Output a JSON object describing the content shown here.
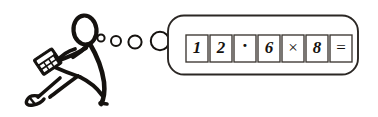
{
  "illustration": {
    "title": "Seated stick figure using a calculator with a thought bubble",
    "background_color": "#ffffff",
    "ink_color": "#15120f",
    "width": 378,
    "height": 117
  },
  "figure": {
    "label": "stick-figure-person",
    "parts": {
      "head": "oval head",
      "torso": "curved back",
      "arms": "bent arms holding calculator",
      "legs": "bent legs with shoe",
      "shoe": "shoe at left foot"
    }
  },
  "calculator": {
    "label": "handheld-calculator",
    "description": "Small tilted calculator held in both hands",
    "keys_visible": 6
  },
  "thought_bubble": {
    "label": "thought-bubble",
    "shape": "rounded-rectangle",
    "border_color": "#2b2724",
    "fill_color": "#ffffff",
    "trail_dots": [
      {
        "cx": 101,
        "cy": 38,
        "r": 3.6
      },
      {
        "cx": 116,
        "cy": 41,
        "r": 5.0
      },
      {
        "cx": 135,
        "cy": 42,
        "r": 6.6
      },
      {
        "cx": 160,
        "cy": 41,
        "r": 9.2
      }
    ],
    "expression_text": "12.6×8=",
    "cells": [
      {
        "char": "1",
        "kind": "digit"
      },
      {
        "char": "2",
        "kind": "digit"
      },
      {
        "char": "·",
        "kind": "decimal-point"
      },
      {
        "char": "6",
        "kind": "digit"
      },
      {
        "char": "×",
        "kind": "operator-multiply"
      },
      {
        "char": "8",
        "kind": "digit"
      },
      {
        "char": "=",
        "kind": "operator-equals"
      }
    ]
  }
}
